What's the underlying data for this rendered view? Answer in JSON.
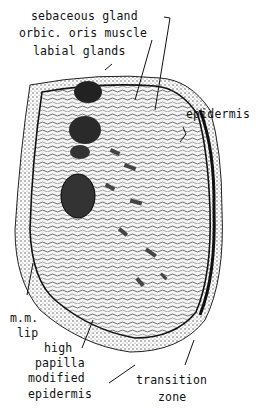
{
  "labels": {
    "sebaceous_gland": "sebaceous gland",
    "orbic_oris_muscle": "orbic. oris muscle",
    "labial_glands": "labial glands",
    "epidermis_top": "epidermis",
    "mm_lip_1": "m.m.",
    "mm_lip_2": "lip",
    "high_papilla_1": "high",
    "high_papilla_2": "papilla",
    "modified_epidermis_1": "modified",
    "modified_epidermis_2": "epidermis",
    "transition_zone_1": "transition",
    "transition_zone_2": "zone"
  },
  "colors": {
    "ink": "#111111",
    "paper": "#ffffff",
    "stipple": "#555555"
  }
}
